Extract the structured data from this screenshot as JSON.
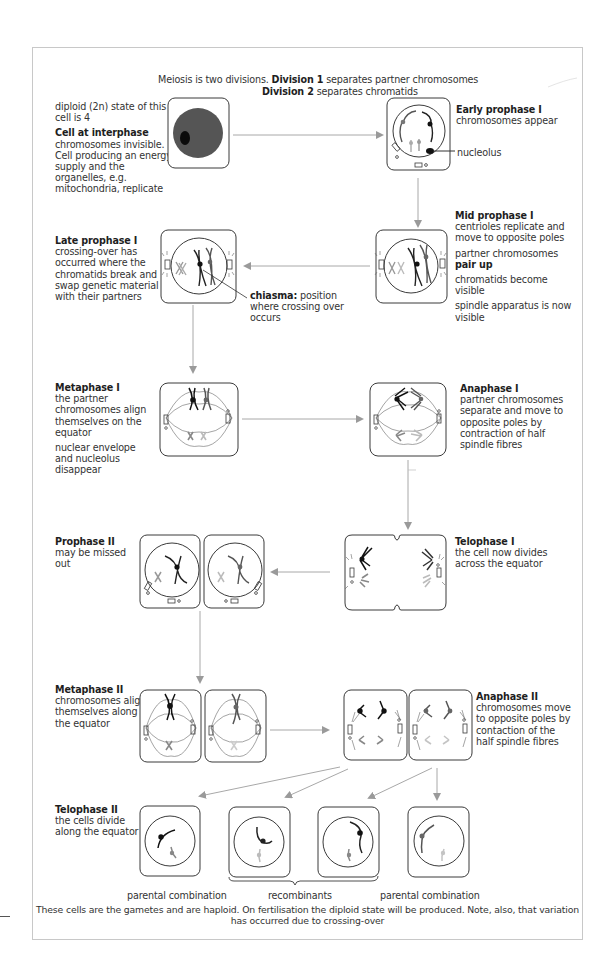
{
  "header": {
    "line1_plain": "Meiosis is two divisions. ",
    "line1_bold": "Division 1",
    "line1_rest": " separates partner chromosomes",
    "line2_bold": "Division 2",
    "line2_rest": " separates chromatids"
  },
  "stages": {
    "interphase": {
      "pre_note": "diploid (2n) state of this cell is 4",
      "title": "Cell at interphase",
      "desc": "chromosomes invisible. Cell producing an energy supply and the organelles, e.g. mitochondria, replicate"
    },
    "early_prophase_1": {
      "title": "Early prophase I",
      "desc": "chromosomes appear",
      "label_nucleolus": "nucleolus"
    },
    "mid_prophase_1": {
      "title": "Mid prophase I",
      "desc1": "centrioles replicate and move to opposite poles",
      "desc2_plain": "partner chromosomes ",
      "desc2_bold": "pair up",
      "desc3": "chromatids become visible",
      "desc4": "spindle apparatus is now visible"
    },
    "late_prophase_1": {
      "title": "Late prophase I",
      "desc": "crossing-over has occurred where the chromatids break and swap genetic material with their partners",
      "chiasma_bold": "chiasma:",
      "chiasma_rest": " position where crossing over occurs"
    },
    "metaphase_1": {
      "title": "Metaphase I",
      "desc1": "the partner chromosomes align themselves on the equator",
      "desc2": "nuclear envelope and nucleolus disappear"
    },
    "anaphase_1": {
      "title": "Anaphase I",
      "desc": "partner chromosomes separate and move to opposite poles by contraction of half spindle fibres"
    },
    "telophase_1": {
      "title": "Telophase I",
      "desc": "the cell now divides across the equator"
    },
    "prophase_2": {
      "title": "Prophase II",
      "desc": "may be missed out"
    },
    "metaphase_2": {
      "title": "Metaphase II",
      "desc": "chromosomes align themselves along the equator"
    },
    "anaphase_2": {
      "title": "Anaphase II",
      "desc": "chromosomes move to opposite poles by contaction of the half spindle fibres"
    },
    "telophase_2": {
      "title": "Telophase II",
      "desc": "the cells divide along the equator"
    }
  },
  "gamete_labels": {
    "left": "parental combination",
    "middle": "recombinants",
    "right": "parental combination"
  },
  "footer": {
    "line1": "These cells are the gametes and are haploid. On fertilisation the diploid state will be produced. Note, also, that variation",
    "line2": "has occurred due to crossing-over"
  },
  "colors": {
    "outline": "#3a3a3a",
    "arrow": "#9a9a9a",
    "cytoplasm_dark": "#555555",
    "chrom_black": "#1a1a1a",
    "chrom_dark_grey": "#6a6a6a",
    "chrom_mid_grey": "#8c8c8c",
    "chrom_light_grey": "#b5b5b5"
  }
}
